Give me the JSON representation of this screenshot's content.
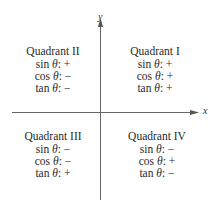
{
  "axes": {
    "x_label": "x",
    "y_label": "y",
    "color": "#555555"
  },
  "theta_symbol": "θ",
  "quadrants": {
    "q1": {
      "title": "Quadrant I",
      "sin": {
        "fn": "sin",
        "sign": "+"
      },
      "cos": {
        "fn": "cos",
        "sign": "+"
      },
      "tan": {
        "fn": "tan",
        "sign": "+"
      }
    },
    "q2": {
      "title": "Quadrant II",
      "sin": {
        "fn": "sin",
        "sign": "+"
      },
      "cos": {
        "fn": "cos",
        "sign": "−"
      },
      "tan": {
        "fn": "tan",
        "sign": "−"
      }
    },
    "q3": {
      "title": "Quadrant III",
      "sin": {
        "fn": "sin",
        "sign": "−"
      },
      "cos": {
        "fn": "cos",
        "sign": "−"
      },
      "tan": {
        "fn": "tan",
        "sign": "+"
      }
    },
    "q4": {
      "title": "Quadrant IV",
      "sin": {
        "fn": "sin",
        "sign": "−"
      },
      "cos": {
        "fn": "cos",
        "sign": "+"
      },
      "tan": {
        "fn": "tan",
        "sign": "−"
      }
    }
  }
}
